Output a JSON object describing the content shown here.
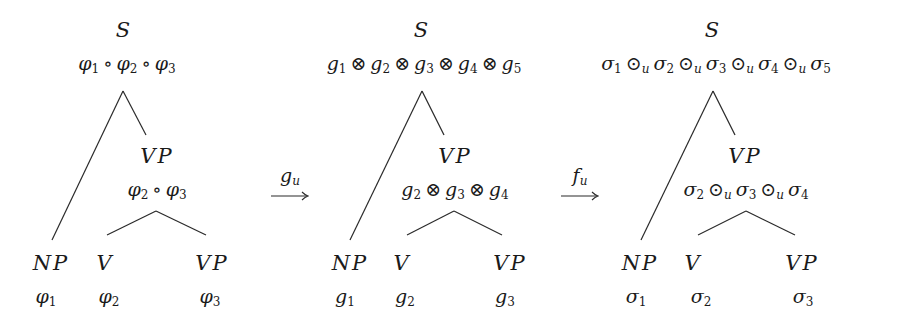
{
  "figure": {
    "trees": [
      {
        "id": "phi-tree",
        "root": {
          "category": "S",
          "semantics": [
            "φ",
            "1",
            "∘",
            "φ",
            "2",
            "∘",
            "φ",
            "3"
          ],
          "semantics_text": "φ1 ∘ φ2 ∘ φ3"
        },
        "vp": {
          "category": "VP",
          "semantics_text": "φ2 ∘ φ3"
        },
        "leaves": [
          {
            "category": "NP",
            "semantics_text": "φ1"
          },
          {
            "category": "V",
            "semantics_text": "φ2"
          },
          {
            "category": "VP",
            "semantics_text": "φ3"
          }
        ]
      },
      {
        "id": "g-tree",
        "root": {
          "category": "S",
          "semantics_text": "g1 ⊗ g2 ⊗ g3 ⊗ g4 ⊗ g5"
        },
        "vp": {
          "category": "VP",
          "semantics_text": "g2 ⊗ g3 ⊗ g4"
        },
        "leaves": [
          {
            "category": "NP",
            "semantics_text": "g1"
          },
          {
            "category": "V",
            "semantics_text": "g2"
          },
          {
            "category": "VP",
            "semantics_text": "g3"
          }
        ]
      },
      {
        "id": "sigma-tree",
        "root": {
          "category": "S",
          "semantics_text": "σ1 ⊙u σ2 ⊙u σ3 ⊙u σ4 ⊙u σ5"
        },
        "vp": {
          "category": "VP",
          "semantics_text": "σ2 ⊙u σ3 ⊙u σ4"
        },
        "leaves": [
          {
            "category": "NP",
            "semantics_text": "σ1"
          },
          {
            "category": "V",
            "semantics_text": "σ2"
          },
          {
            "category": "VP",
            "semantics_text": "σ3"
          }
        ]
      }
    ],
    "arrows": [
      {
        "label": "g",
        "label_sub": "u",
        "from": "phi-tree",
        "to": "g-tree"
      },
      {
        "label": "f",
        "label_sub": "u",
        "from": "g-tree",
        "to": "sigma-tree"
      }
    ],
    "symbols": {
      "phi": "φ",
      "sigma": "σ",
      "g": "g",
      "compose": "∘",
      "otimes": "⊗",
      "odot": "⊙",
      "u": "u",
      "s1": "1",
      "s2": "2",
      "s3": "3",
      "s4": "4",
      "s5": "5"
    },
    "categories": {
      "S": "S",
      "VP": "VP",
      "NP": "NP",
      "V": "V"
    },
    "colors": {
      "ink": "#1a1a1a",
      "background": "#ffffff"
    }
  }
}
